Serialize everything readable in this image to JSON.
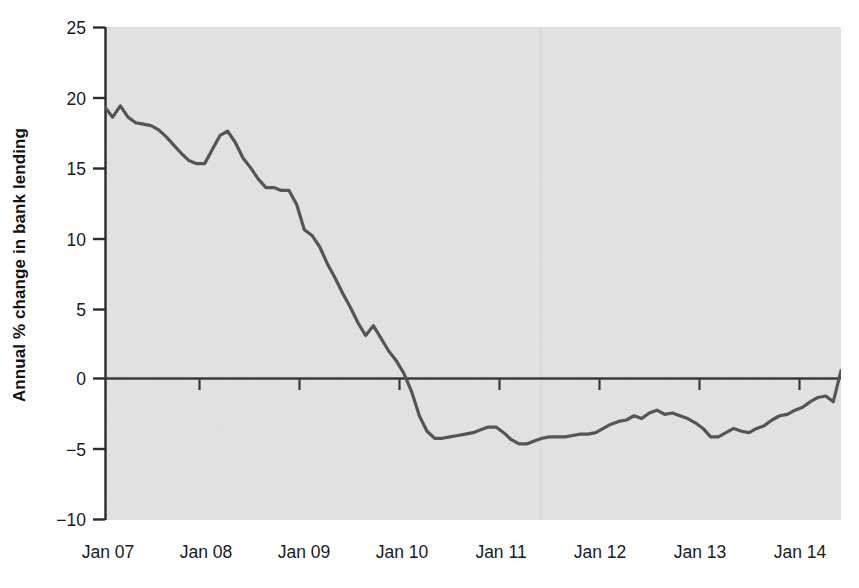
{
  "chart_data": {
    "type": "line",
    "title": "",
    "subtitle": "",
    "xlabel": "",
    "ylabel": "Annual % change in bank lending",
    "ylim": [
      -10,
      25
    ],
    "yticks": [
      25,
      20,
      15,
      10,
      5,
      0,
      -5,
      -10
    ],
    "ytick_labels": [
      "25",
      "20",
      "15",
      "10",
      "5",
      "0",
      "−5",
      "−10"
    ],
    "xlim": [
      "Jan 07",
      "Jan 15"
    ],
    "xticks": [
      "Jan 07",
      "Jan 08",
      "Jan 09",
      "Jan 10",
      "Jan 11",
      "Jan 12",
      "Jan 13",
      "Jan 14"
    ],
    "xtick_labels": [
      "Jan 07",
      "Jan 08",
      "Jan 09",
      "Jan 10",
      "Jan 11",
      "Jan 12",
      "Jan 13",
      "Jan 14"
    ],
    "grid": false,
    "legend": null,
    "legend_position": "none",
    "line_color": "#555555",
    "plot_background": "#e3e3e3",
    "figure_background": "#ffffff",
    "zero_line": 0,
    "annotations": [],
    "series": [
      {
        "name": "Annual % change in bank lending",
        "x": [
          "Jan 07",
          "Feb 07",
          "Mar 07",
          "Apr 07",
          "May 07",
          "Jun 07",
          "Jul 07",
          "Aug 07",
          "Sep 07",
          "Oct 07",
          "Nov 07",
          "Dec 07",
          "Jan 08",
          "Feb 08",
          "Mar 08",
          "Apr 08",
          "May 08",
          "Jun 08",
          "Jul 08",
          "Aug 08",
          "Sep 08",
          "Oct 08",
          "Nov 08",
          "Dec 08",
          "Jan 09",
          "Feb 09",
          "Mar 09",
          "Apr 09",
          "May 09",
          "Jun 09",
          "Jul 09",
          "Aug 09",
          "Sep 09",
          "Oct 09",
          "Nov 09",
          "Dec 09",
          "Jan 10",
          "Feb 10",
          "Mar 10",
          "Apr 10",
          "May 10",
          "Jun 10",
          "Jul 10",
          "Aug 10",
          "Sep 10",
          "Oct 10",
          "Nov 10",
          "Dec 10",
          "Jan 11",
          "Feb 11",
          "Mar 11",
          "Apr 11",
          "May 11",
          "Jun 11",
          "Jul 11",
          "Aug 11",
          "Sep 11",
          "Oct 11",
          "Nov 11",
          "Dec 11",
          "Jan 12",
          "Feb 12",
          "Mar 12",
          "Apr 12",
          "May 12",
          "Jun 12",
          "Jul 12",
          "Aug 12",
          "Sep 12",
          "Oct 12",
          "Nov 12",
          "Dec 12",
          "Jan 13",
          "Feb 13",
          "Mar 13",
          "Apr 13",
          "May 13",
          "Jun 13",
          "Jul 13",
          "Aug 13",
          "Sep 13",
          "Oct 13",
          "Nov 13",
          "Dec 13",
          "Jan 14",
          "Feb 14",
          "Mar 14",
          "Apr 14",
          "May 14",
          "Jun 14",
          "Jul 14",
          "Aug 14",
          "Sep 14",
          "Oct 14",
          "Nov 14",
          "Dec 14",
          "Jan 15"
        ],
        "values": [
          19.3,
          18.6,
          19.4,
          18.6,
          18.2,
          18.1,
          18.0,
          17.7,
          17.2,
          16.6,
          16.0,
          15.5,
          15.3,
          15.3,
          16.3,
          17.3,
          17.6,
          16.8,
          15.7,
          15.0,
          14.2,
          13.6,
          13.6,
          13.4,
          13.4,
          12.4,
          10.6,
          10.2,
          9.4,
          8.2,
          7.2,
          6.1,
          5.1,
          4.0,
          3.1,
          3.8,
          2.9,
          2.0,
          1.3,
          0.4,
          -0.9,
          -2.6,
          -3.7,
          -4.2,
          -4.2,
          -4.1,
          -4.0,
          -3.9,
          -3.8,
          -3.6,
          -3.4,
          -3.4,
          -3.8,
          -4.3,
          -4.6,
          -4.6,
          -4.4,
          -4.2,
          -4.1,
          -4.1,
          -4.1,
          -4.0,
          -3.9,
          -3.9,
          -3.8,
          -3.5,
          -3.2,
          -3.0,
          -2.9,
          -2.6,
          -2.8,
          -2.4,
          -2.2,
          -2.5,
          -2.4,
          -2.6,
          -2.8,
          -3.1,
          -3.5,
          -4.1,
          -4.1,
          -3.8,
          -3.5,
          -3.7,
          -3.8,
          -3.5,
          -3.3,
          -2.9,
          -2.6,
          -2.5,
          -2.2,
          -2.0,
          -1.6,
          -1.3,
          -1.2,
          -1.6,
          0.6
        ]
      }
    ]
  },
  "axes": {
    "y_axis_title": "Annual % change in bank lending"
  }
}
